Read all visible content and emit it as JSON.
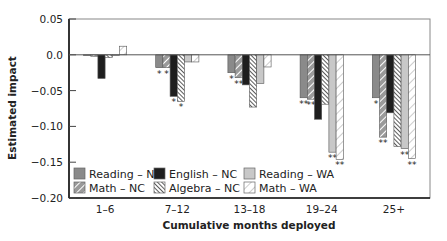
{
  "chart_data": {
    "type": "bar",
    "title": "",
    "xlabel": "Cumulative months deployed",
    "ylabel": "Estimated impact",
    "ylim": [
      -0.2,
      0.05
    ],
    "yticks": [
      0.05,
      0.0,
      -0.05,
      -0.1,
      -0.15,
      -0.2
    ],
    "ytick_labels": [
      "0.05",
      "0.0",
      "−0.05",
      "−0.10",
      "−0.15",
      "−0.20"
    ],
    "categories": [
      "1–6",
      "7–12",
      "13–18",
      "19–24",
      "25+"
    ],
    "grid": false,
    "legend_position": "lower-left inside plot",
    "series": [
      {
        "name": "Reading – NC",
        "fill": "#8a8a8a",
        "pattern": "solid",
        "values": [
          -0.001,
          -0.018,
          -0.025,
          -0.06,
          -0.06
        ],
        "significance": [
          "",
          "*",
          "*",
          "**",
          "*"
        ]
      },
      {
        "name": "Math – NC",
        "fill": "#8f8f8f",
        "pattern": "diag-light",
        "values": [
          -0.002,
          -0.018,
          -0.032,
          -0.062,
          -0.115
        ],
        "significance": [
          "",
          "*",
          "**",
          "**",
          "**"
        ]
      },
      {
        "name": "English – NC",
        "fill": "#1e1e1e",
        "pattern": "solid",
        "values": [
          -0.033,
          -0.058,
          -0.042,
          -0.09,
          -0.081
        ],
        "significance": [
          "",
          "*",
          "",
          "",
          ""
        ]
      },
      {
        "name": "Algebra – NC",
        "fill": "#ffffff",
        "pattern": "diag-dense",
        "values": [
          -0.004,
          -0.065,
          -0.073,
          -0.069,
          -0.128
        ],
        "significance": [
          "",
          "*",
          "",
          "",
          ""
        ]
      },
      {
        "name": "Reading – WA",
        "fill": "#c8c8c8",
        "pattern": "solid",
        "values": [
          -0.001,
          -0.01,
          -0.04,
          -0.136,
          -0.131
        ],
        "significance": [
          "",
          "",
          "",
          "**",
          "**"
        ]
      },
      {
        "name": "Math – WA",
        "fill": "#ffffff",
        "pattern": "diag-open",
        "values": [
          0.012,
          -0.01,
          -0.017,
          -0.146,
          -0.145
        ],
        "significance": [
          "",
          "",
          "",
          "**",
          "**"
        ]
      }
    ]
  },
  "legend": {
    "items": [
      {
        "label": "Reading – NC"
      },
      {
        "label": "English – NC"
      },
      {
        "label": "Reading – WA"
      },
      {
        "label": "Math – NC"
      },
      {
        "label": "Algebra – NC"
      },
      {
        "label": "Math – WA"
      }
    ]
  }
}
